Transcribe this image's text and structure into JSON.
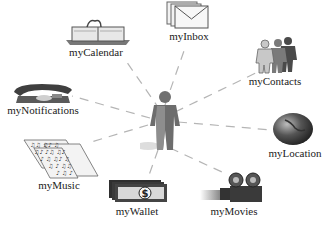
{
  "diagram": {
    "type": "hub-and-spoke",
    "center": {
      "label": "",
      "icon": "person-icon"
    },
    "nodes": [
      {
        "id": "calendar",
        "label": "myCalendar",
        "icon": "calendar-icon"
      },
      {
        "id": "inbox",
        "label": "myInbox",
        "icon": "envelope-icon"
      },
      {
        "id": "contacts",
        "label": "myContacts",
        "icon": "people-icon"
      },
      {
        "id": "notifications",
        "label": "myNotifications",
        "icon": "telephone-icon"
      },
      {
        "id": "location",
        "label": "myLocation",
        "icon": "globe-icon"
      },
      {
        "id": "music",
        "label": "myMusic",
        "icon": "sheet-music-icon"
      },
      {
        "id": "wallet",
        "label": "myWallet",
        "icon": "money-icon"
      },
      {
        "id": "movies",
        "label": "myMovies",
        "icon": "movie-camera-icon"
      }
    ],
    "edges_style": "dashed",
    "colors": {
      "line": "#b0b0b0",
      "icon_dark": "#555555",
      "icon_mid": "#888888",
      "text": "#222222"
    }
  }
}
